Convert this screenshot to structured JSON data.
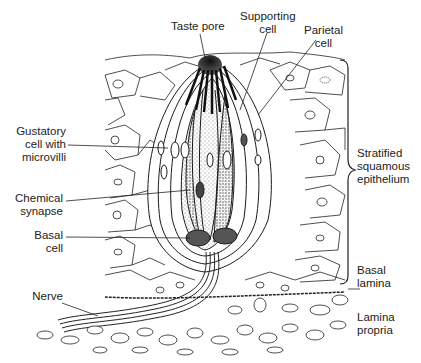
{
  "figure": {
    "labels": {
      "taste_pore": "Taste pore",
      "supporting_cell": [
        "Supporting",
        "cell"
      ],
      "parietal_cell": [
        "Parietal",
        "cell"
      ],
      "gustatory_cell": [
        "Gustatory",
        "cell with",
        "microvilli"
      ],
      "chemical_synapse": [
        "Chemical",
        "synapse"
      ],
      "basal_cell": [
        "Basal",
        "cell"
      ],
      "nerve": "Nerve",
      "stratified_epithelium": [
        "Stratified",
        "squamous",
        "epithelium"
      ],
      "basal_lamina": [
        "Basal",
        "lamina"
      ],
      "lamina_propria": [
        "Lamina",
        "propria"
      ]
    },
    "colors": {
      "ink": "#1a1a1a",
      "background": "#ffffff",
      "stipple": "#777777"
    }
  }
}
